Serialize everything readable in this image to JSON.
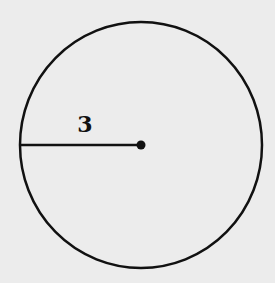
{
  "diagram": {
    "shape": "circle",
    "radius_label": "3",
    "colors": {
      "background": "#ececec",
      "stroke": "#111111"
    }
  }
}
